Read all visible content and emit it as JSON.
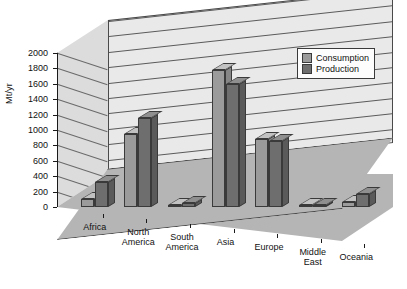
{
  "chart_data": {
    "type": "bar",
    "title": "",
    "xlabel": "",
    "ylabel": "Mt/yr",
    "ylim": [
      0,
      2000
    ],
    "ytick_step": 200,
    "yticks": [
      2000,
      1800,
      1600,
      1400,
      1200,
      1000,
      800,
      600,
      400,
      200,
      0
    ],
    "grid": true,
    "projection": "3d",
    "legend_position": "upper-right",
    "categories": [
      "Africa",
      "North America",
      "South America",
      "Asia",
      "Europe",
      "Middle East",
      "Oceania"
    ],
    "series": [
      {
        "name": "Consumption",
        "color": "#9b9b9b",
        "values": [
          110,
          950,
          30,
          1780,
          880,
          10,
          60
        ]
      },
      {
        "name": "Production",
        "color": "#6e6e6e",
        "values": [
          330,
          1150,
          50,
          1600,
          860,
          30,
          170
        ]
      }
    ]
  },
  "legend": {
    "items": [
      {
        "label": "Consumption",
        "color": "#9b9b9b"
      },
      {
        "label": "Production",
        "color": "#6e6e6e"
      }
    ]
  },
  "colors": {
    "back_wall": "#e9e9e9",
    "left_wall": "#dcdcdc",
    "floor": "#b5b5b5",
    "gridline": "#5a5a5a",
    "axis": "#1a1a1a",
    "text": "#111111",
    "consumption": "#9b9b9b",
    "production": "#6e6e6e"
  }
}
